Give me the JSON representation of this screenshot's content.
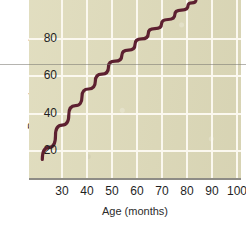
{
  "chart_data": {
    "type": "line",
    "title": "",
    "xlabel": "Age (months)",
    "ylabel": "Percentage correct",
    "xlim": [
      25,
      105
    ],
    "ylim": [
      0,
      96
    ],
    "xticks": [
      30,
      40,
      50,
      60,
      70,
      80,
      90,
      100
    ],
    "yticks": [
      20,
      40,
      60,
      80
    ],
    "grid": true,
    "legend": null,
    "series": [
      {
        "name": "Percentage correct by age",
        "color": "#5d2030",
        "x": [
          30,
          35,
          40,
          45,
          50,
          55,
          60,
          65,
          70,
          75,
          80,
          85,
          88
        ],
        "y": [
          10,
          23,
          34,
          44,
          52,
          60,
          66,
          72,
          78,
          83,
          88,
          93,
          96
        ]
      }
    ],
    "colors": {
      "plot_background": "#dedab9",
      "gridline": "#fbf8ef",
      "axis": "#8e8c86",
      "curve": "#5d2030",
      "text": "#1f1f1f",
      "page_background": "#ffffff"
    }
  },
  "axes": {
    "y_title": "Percentage correct",
    "x_title": "Age (months)",
    "y_tick_labels": [
      "80",
      "60",
      "40",
      "20"
    ],
    "x_tick_labels": [
      "30",
      "40",
      "50",
      "60",
      "70",
      "80",
      "90",
      "100"
    ]
  }
}
